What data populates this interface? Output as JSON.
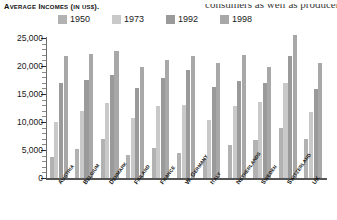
{
  "page_bleed_text": "consumers as well as producer",
  "figure": {
    "title_main": "A",
    "title": "Average Incomes (in US$).",
    "title_parts": {
      "a": "A",
      "verage": "VERAGE",
      "i": "I",
      "ncomes": "NCOMES",
      "in": "IN",
      "us": "US$",
      "tail": ")."
    }
  },
  "legend": {
    "position": "top",
    "items": [
      {
        "label": "1950",
        "color": "#b2b2b2"
      },
      {
        "label": "1973",
        "color": "#c9c9c9"
      },
      {
        "label": "1992",
        "color": "#9a9a9a"
      },
      {
        "label": "1998",
        "color": "#a8a8a8"
      }
    ]
  },
  "axis": {
    "y_ticks": [
      "25,000",
      "20,000",
      "15,000",
      "10,000",
      "5,000",
      "0"
    ],
    "y_min": 0,
    "y_max": 25000,
    "y_step": 5000,
    "y_minor_step": 1000
  },
  "chart_data": {
    "type": "bar",
    "title": "Average Incomes (in US$).",
    "xlabel": "",
    "ylabel": "",
    "ylim": [
      0,
      25000
    ],
    "ytick_step": 5000,
    "grid": false,
    "legend_position": "top",
    "categories": [
      "Austria",
      "Belgium",
      "Denmark",
      "Finland",
      "France",
      "W. Germany",
      "Italy",
      "Netherlands",
      "Sweden",
      "Switzerland",
      "UK"
    ],
    "series": [
      {
        "name": "1950",
        "color": "#b2b2b2",
        "values": [
          3700,
          5100,
          6900,
          4100,
          5300,
          4400,
          3500,
          5900,
          6700,
          9000,
          6900
        ]
      },
      {
        "name": "1973",
        "color": "#c9c9c9",
        "values": [
          10000,
          11900,
          13400,
          10800,
          12900,
          13100,
          10400,
          12800,
          13500,
          17000,
          11800
        ]
      },
      {
        "name": "1992",
        "color": "#9a9a9a",
        "values": [
          17000,
          17500,
          18400,
          16000,
          17800,
          19300,
          16300,
          17400,
          16900,
          21700,
          15900
        ]
      },
      {
        "name": "1998",
        "color": "#a8a8a8",
        "values": [
          21800,
          22100,
          22700,
          19800,
          21000,
          21800,
          20600,
          21900,
          19800,
          25500,
          20600
        ]
      }
    ]
  },
  "country_labels": [
    {
      "first": "A",
      "rest": "USTRIA"
    },
    {
      "first": "B",
      "rest": "ELGIUM"
    },
    {
      "first": "D",
      "rest": "ENMARK"
    },
    {
      "first": "F",
      "rest": "INLAND"
    },
    {
      "first": "F",
      "rest": "RANCE"
    },
    {
      "first": "W. G",
      "rest": "ERMANY"
    },
    {
      "first": "I",
      "rest": "TALY"
    },
    {
      "first": "N",
      "rest": "ETHERLANDS"
    },
    {
      "first": "S",
      "rest": "WEDEN"
    },
    {
      "first": "S",
      "rest": "WITZERLAND"
    },
    {
      "first": "UK",
      "rest": ""
    }
  ]
}
